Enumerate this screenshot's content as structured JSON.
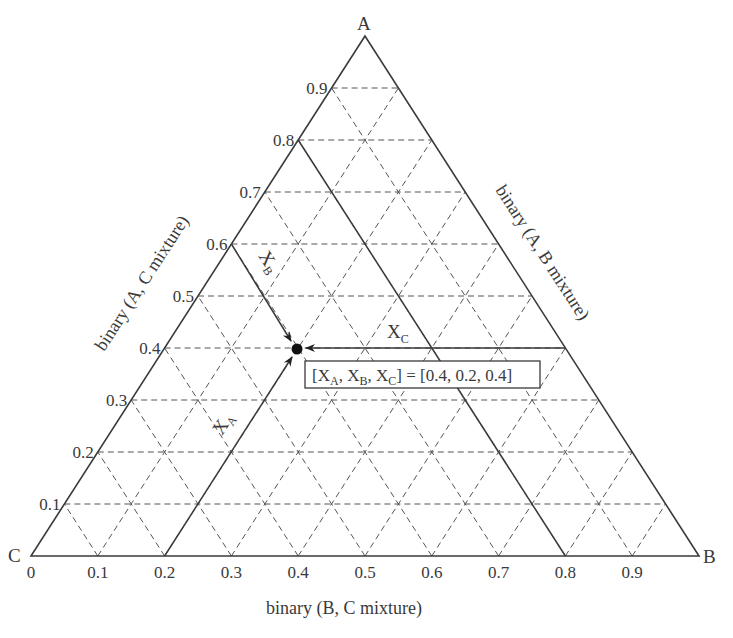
{
  "diagram": {
    "type": "ternary",
    "corners": {
      "top": "A",
      "left": "C",
      "right": "B"
    },
    "edge_titles": {
      "left": "binary (A, C mixture)",
      "right": "binary (A, B mixture)",
      "bottom": "binary (B, C mixture)"
    },
    "left_ticks": [
      "0.1",
      "0.2",
      "0.3",
      "0.4",
      "0.5",
      "0.6",
      "0.7",
      "0.8",
      "0.9"
    ],
    "bottom_ticks": [
      "0",
      "0.1",
      "0.2",
      "0.3",
      "0.4",
      "0.5",
      "0.6",
      "0.7",
      "0.8",
      "0.9"
    ],
    "point": {
      "XA": 0.4,
      "XB": 0.2,
      "XC": 0.4
    },
    "arrow_labels": {
      "xa": "X",
      "xa_sub": "A",
      "xb": "X",
      "xb_sub": "B",
      "xc": "X",
      "xc_sub": "C"
    },
    "annotation": {
      "open": "[X",
      "sub_a": "A",
      "comma1": ", X",
      "sub_b": "B",
      "comma2": ", X",
      "sub_c": "C",
      "rest": "] = [0.4, 0.2, 0.4]"
    },
    "colors": {
      "line": "#3a3a3a",
      "grid": "#555555",
      "background": "#ffffff"
    }
  }
}
